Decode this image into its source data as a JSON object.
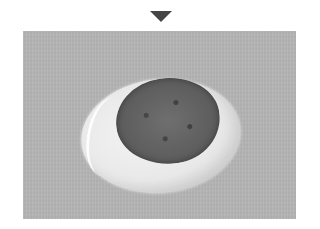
{
  "figure": {
    "arrow": {
      "direction": "down",
      "color": "#454545"
    },
    "photo": {
      "subject": "dark patty on oval layer of white cream on gray wooden board",
      "colors": {
        "board": "#b4b4b4",
        "cream": "#ececec",
        "patty": "#5e5e5e"
      }
    }
  }
}
